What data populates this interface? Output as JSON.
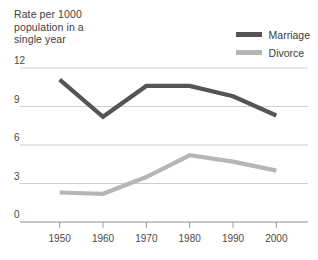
{
  "chart_data": {
    "type": "line",
    "title": "Rate per 1000 population in a single year",
    "title_lines": [
      "Rate per 1000",
      "population in a",
      "single year"
    ],
    "xlabel": "",
    "ylabel": "",
    "x": [
      1950,
      1960,
      1970,
      1980,
      1990,
      2000
    ],
    "categories": [
      "1950",
      "1960",
      "1970",
      "1980",
      "1990",
      "2000"
    ],
    "series": [
      {
        "name": "Marriage",
        "color": "#555555",
        "values": [
          11.1,
          8.2,
          10.6,
          10.6,
          9.8,
          8.3
        ]
      },
      {
        "name": "Divorce",
        "color": "#b6b6b6",
        "values": [
          2.3,
          2.2,
          3.5,
          5.2,
          4.7,
          4.0
        ]
      }
    ],
    "ylim": [
      0,
      13
    ],
    "xlim": [
      1945,
      2005
    ],
    "yticks": [
      0,
      3,
      6,
      9,
      12
    ],
    "ytick_labels": [
      "0",
      "3",
      "6",
      "9",
      "12"
    ],
    "xticks": [
      1950,
      1960,
      1970,
      1980,
      1990,
      2000
    ],
    "xtick_labels": [
      "1950",
      "1960",
      "1970",
      "1980",
      "1990",
      "2000"
    ],
    "grid": true,
    "grid_color": "#c9c9c9",
    "axis_color": "#8f8f8f",
    "legend_position": "top-right",
    "legend": [
      "Marriage",
      "Divorce"
    ]
  },
  "legend": {
    "items": [
      {
        "label": "Marriage",
        "color": "#555555"
      },
      {
        "label": "Divorce",
        "color": "#b6b6b6"
      }
    ]
  },
  "colors": {
    "marriage": "#555555",
    "divorce": "#b6b6b6",
    "grid": "#c9c9c9",
    "axis": "#8f8f8f",
    "text": "#3d3d3d",
    "background": "#ffffff"
  }
}
